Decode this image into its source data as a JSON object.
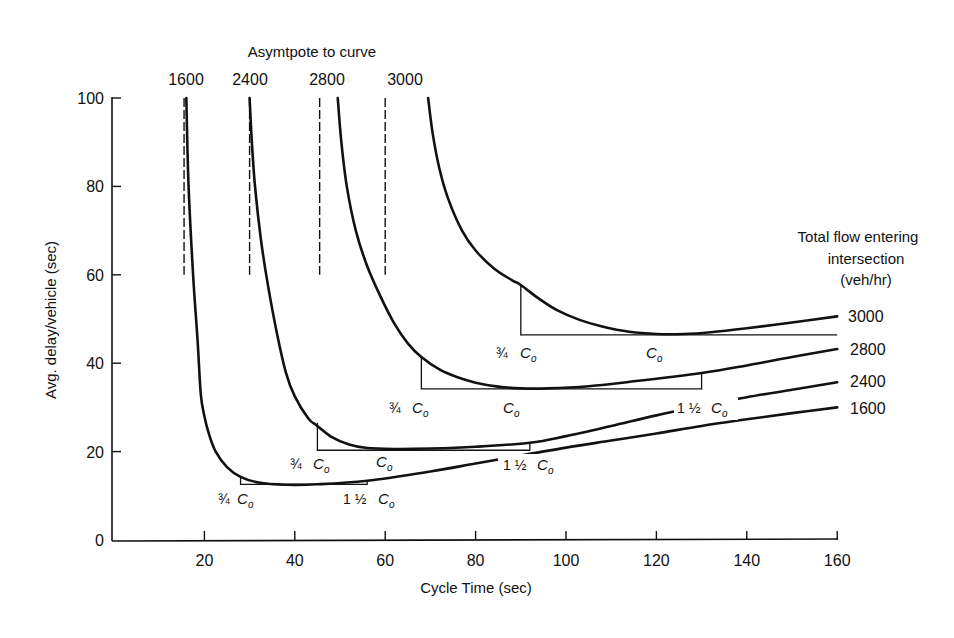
{
  "chart_data": {
    "type": "line",
    "title": "",
    "xlabel": "Cycle Time (sec)",
    "ylabel": "Avg. delay/vehicle (sec)",
    "xlim": [
      0,
      160
    ],
    "ylim": [
      0,
      100
    ],
    "xticks": [
      20,
      40,
      60,
      80,
      100,
      120,
      140,
      160
    ],
    "yticks": [
      0,
      20,
      40,
      60,
      80,
      100
    ],
    "grid": false,
    "legend": {
      "title_lines": [
        "Total flow entering",
        "intersection",
        "(veh/hr)"
      ],
      "position": "right",
      "entries": [
        "3000",
        "2800",
        "2400",
        "1600"
      ]
    },
    "asymptote_title": "Asymtpote to curve",
    "series": [
      {
        "name": "1600",
        "asymptote_x": 15.5,
        "optimum_cycle_Co": 37,
        "bracket": {
          "x_start": 28,
          "x_end": 56,
          "y": 12.6,
          "top_y": 14.5,
          "right_top_y": 13.5
        },
        "points": [
          [
            16,
            100
          ],
          [
            16.5,
            80
          ],
          [
            17.5,
            60
          ],
          [
            18.5,
            45
          ],
          [
            19.2,
            33
          ],
          [
            20,
            28
          ],
          [
            21,
            24
          ],
          [
            22.5,
            20
          ],
          [
            25,
            16.5
          ],
          [
            28,
            14.3
          ],
          [
            32,
            13.0
          ],
          [
            38,
            12.5
          ],
          [
            45,
            12.6
          ],
          [
            56,
            13.4
          ],
          [
            70,
            15.5
          ],
          [
            80,
            17.3
          ],
          [
            90,
            19.1
          ],
          [
            100,
            20.9
          ],
          [
            110,
            22.5
          ],
          [
            120,
            24.1
          ],
          [
            130,
            25.8
          ],
          [
            140,
            27.3
          ],
          [
            150,
            28.7
          ],
          [
            160,
            30.0
          ]
        ]
      },
      {
        "name": "2400",
        "asymptote_x": 30,
        "optimum_cycle_Co": 58,
        "bracket": {
          "x_start": 45,
          "x_end": 92,
          "y": 20.3,
          "top_y": 26.5,
          "right_top_y": 22.0
        },
        "points": [
          [
            30,
            100
          ],
          [
            30.5,
            90
          ],
          [
            31.2,
            80
          ],
          [
            32.5,
            68
          ],
          [
            34,
            58
          ],
          [
            36,
            47
          ],
          [
            38,
            38
          ],
          [
            40,
            32.5
          ],
          [
            43,
            27.5
          ],
          [
            45,
            25.8
          ],
          [
            48,
            23.4
          ],
          [
            52,
            21.6
          ],
          [
            56,
            20.8
          ],
          [
            62,
            20.6
          ],
          [
            70,
            20.7
          ],
          [
            80,
            21.1
          ],
          [
            92,
            22.0
          ],
          [
            100,
            23.5
          ],
          [
            110,
            25.8
          ],
          [
            120,
            28.2
          ],
          [
            130,
            30.3
          ],
          [
            140,
            32.3
          ],
          [
            150,
            34.0
          ],
          [
            160,
            35.7
          ]
        ]
      },
      {
        "name": "2800",
        "asymptote_x": 45.5,
        "optimum_cycle_Co": 88,
        "bracket": {
          "x_start": 68,
          "x_end": 130,
          "y": 34.2,
          "top_y": 41.4,
          "right_top_y": 37.6
        },
        "points": [
          [
            49.5,
            100
          ],
          [
            50.3,
            90
          ],
          [
            51.5,
            80
          ],
          [
            53.5,
            70
          ],
          [
            56,
            62
          ],
          [
            59,
            55
          ],
          [
            62,
            49
          ],
          [
            65,
            44.5
          ],
          [
            68,
            41.4
          ],
          [
            72,
            38.6
          ],
          [
            76,
            36.8
          ],
          [
            80,
            35.6
          ],
          [
            85,
            34.7
          ],
          [
            90,
            34.3
          ],
          [
            96,
            34.3
          ],
          [
            105,
            34.8
          ],
          [
            115,
            35.9
          ],
          [
            130,
            37.8
          ],
          [
            140,
            39.5
          ],
          [
            150,
            41.4
          ],
          [
            160,
            43.2
          ]
        ]
      },
      {
        "name": "3000",
        "asymptote_x": 60,
        "optimum_cycle_Co": 120,
        "bracket": {
          "x_start": 90,
          "x_end": 160,
          "y": 46.4,
          "top_y": 57.7
        },
        "points": [
          [
            69.5,
            100
          ],
          [
            70.5,
            92
          ],
          [
            72,
            84
          ],
          [
            74,
            77
          ],
          [
            77,
            70
          ],
          [
            80,
            65.5
          ],
          [
            84,
            61.5
          ],
          [
            88,
            58.8
          ],
          [
            90,
            57.7
          ],
          [
            94,
            54.6
          ],
          [
            98,
            52.0
          ],
          [
            103,
            49.8
          ],
          [
            108,
            48.3
          ],
          [
            114,
            47.1
          ],
          [
            120,
            46.6
          ],
          [
            126,
            46.6
          ],
          [
            132,
            47.0
          ],
          [
            140,
            47.9
          ],
          [
            150,
            49.2
          ],
          [
            160,
            50.6
          ]
        ]
      }
    ],
    "annotations": [
      {
        "text": "3/4 Co",
        "series": "1600",
        "x": 28
      },
      {
        "text": "1 1/2 Co",
        "series": "1600",
        "x": 56
      },
      {
        "text": "3/4 Co",
        "series": "2400",
        "x": 45
      },
      {
        "text": "Co",
        "series": "2400",
        "x": 58
      },
      {
        "text": "1 1/2 Co",
        "series": "2400",
        "x": 92
      },
      {
        "text": "3/4 Co",
        "series": "2800",
        "x": 68
      },
      {
        "text": "Co",
        "series": "2800",
        "x": 88
      },
      {
        "text": "1 1/2 Co",
        "series": "2800",
        "x": 130
      },
      {
        "text": "3/4 Co",
        "series": "3000",
        "x": 90
      },
      {
        "text": "Co",
        "series": "3000",
        "x": 120
      }
    ]
  },
  "labels": {
    "asymptote_title": "Asymtpote to curve",
    "asymptote_values": [
      "1600",
      "2400",
      "2800",
      "3000"
    ],
    "x_axis_title": "Cycle Time (sec)",
    "y_axis_title": "Avg. delay/vehicle (sec)",
    "legend_line1": "Total flow entering",
    "legend_line2": "intersection",
    "legend_line3": "(veh/hr)",
    "legend_3000": "3000",
    "legend_2800": "2800",
    "legend_2400": "2400",
    "legend_1600": "1600",
    "three_quarter": "¾",
    "one_and_half": "1 ½",
    "co_main": "C",
    "co_sub": "o"
  }
}
